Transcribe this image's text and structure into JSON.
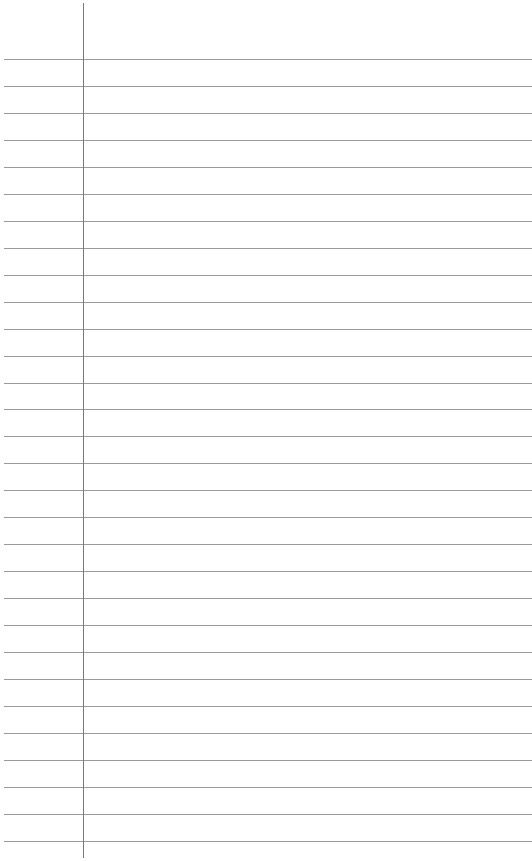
{
  "paper": {
    "type": "lined-paper",
    "background_color": "#ffffff",
    "rule_color": "#8a8a8a",
    "margin_line_color": "#7a7a7a",
    "margin_line_x": 83,
    "margin_line_top": 3,
    "margin_line_bottom": 858,
    "first_rule_y": 59,
    "rule_spacing": 26.96,
    "rule_count": 30
  }
}
